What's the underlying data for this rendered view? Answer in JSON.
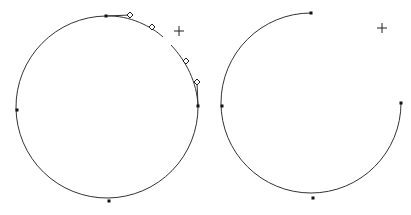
{
  "canvas": {
    "width": 411,
    "height": 215,
    "background": "#ffffff",
    "stroke": "#333333"
  },
  "left_figure": {
    "description": "closed circle path with selected segment showing bezier handles",
    "arc_path": "M 106 16 A 91 91 0 1 0 198 106",
    "segment_path_a": "M 106 16 C 130 15 152 27 163 37",
    "segment_path_b": "M 171 45 C 186 61 197 82 198 106",
    "anchors": [
      {
        "name": "top",
        "x": 106,
        "y": 16
      },
      {
        "name": "left",
        "x": 17,
        "y": 110
      },
      {
        "name": "bottom",
        "x": 109,
        "y": 201
      },
      {
        "name": "right",
        "x": 198,
        "y": 106
      }
    ],
    "handle_lines": [
      {
        "x1": 106,
        "y1": 16,
        "x2": 130,
        "y2": 15
      },
      {
        "x1": 198,
        "y1": 106,
        "x2": 197,
        "y2": 82
      }
    ],
    "handles": [
      {
        "x": 130,
        "y": 15
      },
      {
        "x": 152,
        "y": 27
      },
      {
        "x": 186,
        "y": 61
      },
      {
        "x": 197,
        "y": 82
      }
    ],
    "crosshair": {
      "x": 179,
      "y": 31
    }
  },
  "right_figure": {
    "description": "open arc path (three-quarter circle) with anchor points",
    "arc_path": "M 311 13 A 90 90 0 1 0 401 103",
    "anchors": [
      {
        "name": "top",
        "x": 311,
        "y": 13
      },
      {
        "name": "left",
        "x": 222,
        "y": 106
      },
      {
        "name": "bottom",
        "x": 313,
        "y": 198
      },
      {
        "name": "right",
        "x": 401,
        "y": 103
      }
    ],
    "crosshair": {
      "x": 382,
      "y": 28
    }
  }
}
